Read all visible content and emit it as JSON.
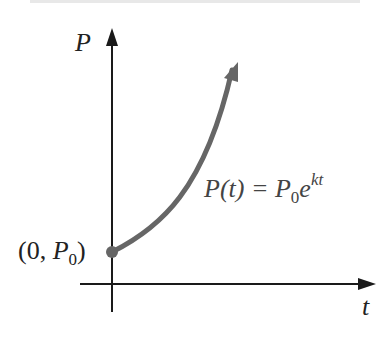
{
  "diagram": {
    "title_fragment": "",
    "y_axis_label": "P",
    "x_axis_label": "t",
    "initial_point_label": {
      "open": "(0, ",
      "var": "P",
      "sub": "0",
      "close": ")"
    },
    "equation": {
      "lhs": "P(t) = ",
      "base": "P",
      "sub": "0",
      "e": "e",
      "exp": "kt"
    },
    "colors": {
      "axes": "#1a1a1a",
      "curve": "#666666",
      "point": "#666666",
      "text": "#222222"
    }
  }
}
